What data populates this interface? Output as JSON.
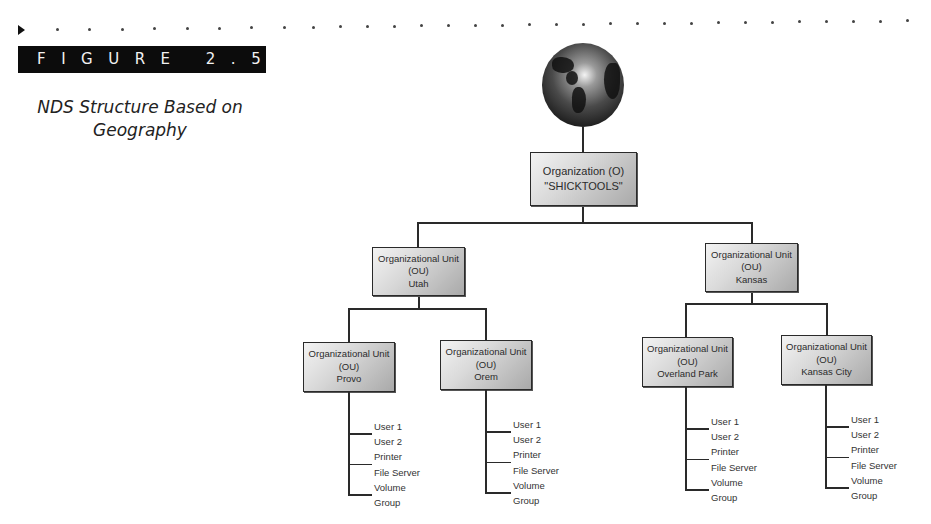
{
  "figure": {
    "label": "FIGURE 2.5",
    "title_line1": "NDS Structure Based on",
    "title_line2": "Geography"
  },
  "root": {
    "icon": "globe-icon",
    "line1": "Organization (O)",
    "line2": "\"SHICKTOOLS\""
  },
  "regions": [
    {
      "line1": "Organizational Unit",
      "line2": "(OU)",
      "line3": "Utah",
      "children": [
        {
          "line1": "Organizational Unit",
          "line2": "(OU)",
          "line3": "Provo",
          "leaves": [
            "User 1",
            "User 2",
            "Printer",
            "File Server",
            "Volume",
            "Group"
          ]
        },
        {
          "line1": "Organizational Unit",
          "line2": "(OU)",
          "line3": "Orem",
          "leaves": [
            "User 1",
            "User 2",
            "Printer",
            "File Server",
            "Volume",
            "Group"
          ]
        }
      ]
    },
    {
      "line1": "Organizational Unit",
      "line2": "(OU)",
      "line3": "Kansas",
      "children": [
        {
          "line1": "Organizational Unit",
          "line2": "(OU)",
          "line3": "Overland Park",
          "leaves": [
            "User 1",
            "User 2",
            "Printer",
            "File Server",
            "Volume",
            "Group"
          ]
        },
        {
          "line1": "Organizational Unit",
          "line2": "(OU)",
          "line3": "Kansas City",
          "leaves": [
            "User 1",
            "User 2",
            "Printer",
            "File Server",
            "Volume",
            "Group"
          ]
        }
      ]
    }
  ]
}
